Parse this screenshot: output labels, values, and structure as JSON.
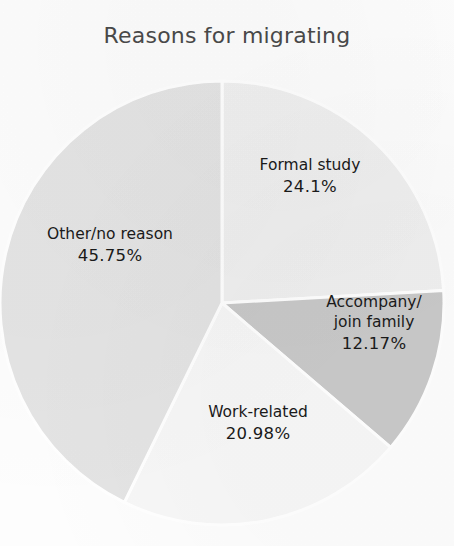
{
  "chart_data": {
    "type": "pie",
    "title": "Reasons for migrating",
    "xlabel": "",
    "ylabel": "",
    "legend": "none",
    "grid": false,
    "start_angle_deg": 0,
    "direction": "clockwise",
    "categories": [
      "Formal study",
      "Accompany/ join family",
      "Work-related",
      "Other/no reason"
    ],
    "values": [
      24.1,
      12.17,
      20.98,
      45.75
    ],
    "units": "percent",
    "slices": [
      {
        "name": "Formal study",
        "label_lines": [
          "Formal study"
        ],
        "value": 24.1,
        "value_text": "24.1%",
        "color": "#f0f0f0",
        "start_deg": 0,
        "end_deg": 86.76
      },
      {
        "name": "Accompany/ join family",
        "label_lines": [
          "Accompany/",
          "join family"
        ],
        "value": 12.17,
        "value_text": "12.17%",
        "color": "#c9c9c9",
        "start_deg": 86.76,
        "end_deg": 130.57
      },
      {
        "name": "Work-related",
        "label_lines": [
          "Work-related"
        ],
        "value": 20.98,
        "value_text": "20.98%",
        "color": "#f7f7f7",
        "start_deg": 130.57,
        "end_deg": 206.1
      },
      {
        "name": "Other/no reason",
        "label_lines": [
          "Other/no reason"
        ],
        "value": 45.75,
        "value_text": "45.75%",
        "color": "#e4e4e4",
        "start_deg": 206.1,
        "end_deg": 360.0
      }
    ]
  },
  "labels": {
    "formal_study": {
      "name": "Formal study",
      "pct": "24.1%"
    },
    "accompany": {
      "name_line1": "Accompany/",
      "name_line2": "join family",
      "pct": "12.17%"
    },
    "work_related": {
      "name": "Work-related",
      "pct": "20.98%"
    },
    "other": {
      "name": "Other/no reason",
      "pct": "45.75%"
    }
  },
  "colors": {
    "formal_study": "#f0f0f0",
    "accompany": "#c9c9c9",
    "work_related": "#f7f7f7",
    "other": "#e4e4e4",
    "separator": "#ffffff",
    "title_text": "#4a4a4a",
    "label_text": "#1a1a1a",
    "background": "#fdfdfd"
  },
  "geometry": {
    "center_x": 222,
    "center_y": 303,
    "radius": 222
  }
}
